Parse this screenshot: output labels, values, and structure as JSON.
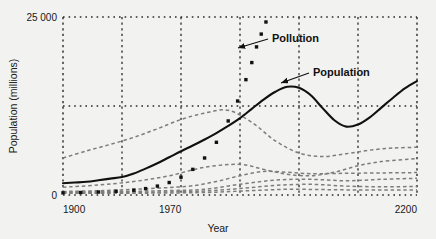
{
  "chart_data": {
    "type": "line",
    "title": "",
    "xlabel": "Year",
    "ylabel": "Population (millions)",
    "xlim": [
      1900,
      2200
    ],
    "ylim": [
      0,
      25000
    ],
    "xticks": [
      1900,
      1970,
      2200
    ],
    "xtick_labels": [
      "1900",
      "1970",
      "2200"
    ],
    "yticks": [
      0,
      25000
    ],
    "ytick_labels": [
      "0",
      "25 000"
    ],
    "grid": "dotted",
    "gridlines_x": [
      1950,
      2000,
      2050,
      2100,
      2150
    ],
    "gridlines_y": [
      12500,
      25000
    ],
    "legend_position": "inline-annotations",
    "annotations": [
      {
        "label": "Pollution",
        "x": 2065,
        "y": 23300
      },
      {
        "label": "Population",
        "x": 2090,
        "y": 17600
      }
    ],
    "series": [
      {
        "name": "Population",
        "style": "solid-bold",
        "marker": "none",
        "color": "#111111",
        "x": [
          1900,
          1910,
          1920,
          1930,
          1940,
          1950,
          1960,
          1970,
          1980,
          1990,
          2000,
          2010,
          2020,
          2030,
          2040,
          2050,
          2060,
          2070,
          2080,
          2090,
          2100,
          2110,
          2120,
          2130,
          2140,
          2150,
          2160,
          2170,
          2180,
          2190,
          2200
        ],
        "y": [
          1650,
          1750,
          1860,
          2070,
          2300,
          2520,
          3020,
          3700,
          4450,
          5300,
          6150,
          6950,
          7800,
          8700,
          9700,
          10800,
          12100,
          13400,
          14500,
          15200,
          15050,
          14000,
          12200,
          10500,
          9600,
          9900,
          10900,
          12300,
          13700,
          15000,
          16000
        ]
      },
      {
        "name": "Pollution",
        "style": "markers",
        "marker": "square",
        "color": "#111111",
        "x": [
          1900,
          1915,
          1930,
          1945,
          1960,
          1970,
          1980,
          1990,
          2000,
          2010,
          2020,
          2030,
          2040,
          2048,
          2055,
          2060,
          2064,
          2068,
          2072
        ],
        "y": [
          300,
          350,
          420,
          520,
          680,
          900,
          1250,
          1750,
          2500,
          3600,
          5200,
          7400,
          10400,
          13200,
          16200,
          18600,
          20800,
          22600,
          24300
        ]
      },
      {
        "name": "series-a",
        "style": "dashed-light",
        "marker": "none",
        "color": "#7d7d7d",
        "x": [
          1900,
          1920,
          1940,
          1960,
          1980,
          2000,
          2020,
          2040,
          2060,
          2080,
          2100,
          2120,
          2140,
          2160,
          2180,
          2200
        ],
        "y": [
          5200,
          6200,
          7100,
          8100,
          9300,
          10600,
          11500,
          11900,
          10200,
          7600,
          5900,
          5400,
          5800,
          6300,
          6600,
          6700
        ]
      },
      {
        "name": "series-b",
        "style": "dashed-light",
        "marker": "none",
        "color": "#7d7d7d",
        "x": [
          1900,
          1930,
          1960,
          1990,
          2020,
          2050,
          2070,
          2090,
          2110,
          2130,
          2150,
          2170,
          2200
        ],
        "y": [
          1100,
          1400,
          1900,
          2700,
          3900,
          4300,
          3600,
          2900,
          2700,
          3200,
          4100,
          4700,
          5100
        ]
      },
      {
        "name": "series-c",
        "style": "dashed-light",
        "marker": "none",
        "color": "#7d7d7d",
        "x": [
          1900,
          1930,
          1960,
          1990,
          2010,
          2030,
          2050,
          2070,
          2090,
          2110,
          2140,
          2170,
          2200
        ],
        "y": [
          500,
          600,
          800,
          1050,
          1300,
          1900,
          2700,
          3300,
          3200,
          3000,
          3050,
          3100,
          3150
        ]
      },
      {
        "name": "series-d",
        "style": "dashed-light",
        "marker": "none",
        "color": "#7d7d7d",
        "x": [
          1900,
          1930,
          1960,
          1990,
          2020,
          2050,
          2080,
          2110,
          2140,
          2170,
          2200
        ],
        "y": [
          400,
          450,
          520,
          620,
          800,
          1500,
          2100,
          2200,
          2000,
          2200,
          2350
        ]
      },
      {
        "name": "series-e",
        "style": "dashed-light",
        "marker": "none",
        "color": "#7d7d7d",
        "x": [
          1900,
          1930,
          1960,
          1990,
          2020,
          2050,
          2080,
          2110,
          2140,
          2170,
          2200
        ],
        "y": [
          350,
          360,
          380,
          430,
          560,
          900,
          1350,
          1500,
          1250,
          1150,
          1200
        ]
      },
      {
        "name": "series-f",
        "style": "dashed-light",
        "marker": "none",
        "color": "#7d7d7d",
        "x": [
          1900,
          1940,
          1970,
          2000,
          2030,
          2060,
          2090,
          2120,
          2150,
          2180,
          2200
        ],
        "y": [
          250,
          250,
          260,
          300,
          400,
          620,
          800,
          760,
          700,
          700,
          720
        ]
      }
    ]
  },
  "axes": {
    "y_max_label": "25 000",
    "y_min_label": "0",
    "x_first_label": "1900",
    "x_mid_label": "1970",
    "x_last_label": "2200",
    "x_title": "Year",
    "y_title": "Population (millions)"
  },
  "annotations": {
    "pollution_label": "Pollution",
    "population_label": "Population"
  },
  "colors": {
    "background": "#f2f2f0",
    "ink": "#111111",
    "light_ink": "#7d7d7d",
    "grid": "#2a2a2a"
  }
}
